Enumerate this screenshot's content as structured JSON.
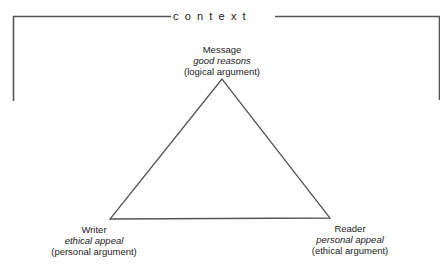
{
  "diagram": {
    "title": "context",
    "nodes": {
      "message": {
        "role": "Message",
        "appeal": "good reasons",
        "argument": "(logical argument)"
      },
      "writer": {
        "role": "Writer",
        "appeal": "ethical appeal",
        "argument": "(personal argument)"
      },
      "reader": {
        "role": "Reader",
        "appeal": "personal appeal",
        "argument": "(ethical argument)"
      }
    },
    "colors": {
      "line": "#555555",
      "text": "#222222",
      "background": "#ffffff"
    }
  }
}
